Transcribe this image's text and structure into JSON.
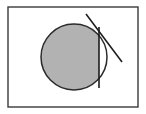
{
  "canvas": {
    "width": 146,
    "height": 114,
    "background_color": "#ffffff",
    "title": "Circle with chord and secant line"
  },
  "colors": {
    "frame_stroke": "#3a3a3a",
    "circle_fill": "#b2b2b2",
    "circle_stroke": "#2b2b2b",
    "chord_stroke": "#1c1c1c",
    "diagonal_stroke": "#1c1c1c",
    "page_background": "#ffffff",
    "frame_fill": "#ffffff"
  },
  "shapes": {
    "frame": {
      "label": "Outer rectangle frame",
      "x": 8,
      "y": 7,
      "width": 130,
      "height": 100,
      "stroke_width": 1.4,
      "fill": "#ffffff"
    },
    "circle": {
      "label": "Shaded circle",
      "cx": 74,
      "cy": 57,
      "r": 33,
      "stroke_width": 1.5,
      "fill": "#b2b2b2"
    },
    "chord": {
      "label": "Vertical chord line",
      "x1": 99,
      "y1": 27,
      "x2": 99,
      "y2": 88,
      "stroke_width": 1.6
    },
    "diagonal": {
      "label": "Diagonal secant line",
      "x1": 86,
      "y1": 14,
      "x2": 122,
      "y2": 62,
      "stroke_width": 1.6
    },
    "segment_clip": {
      "label": "Gray fill clipped to left of chord",
      "x": 0,
      "y": 0,
      "width": 99,
      "height": 114
    }
  }
}
